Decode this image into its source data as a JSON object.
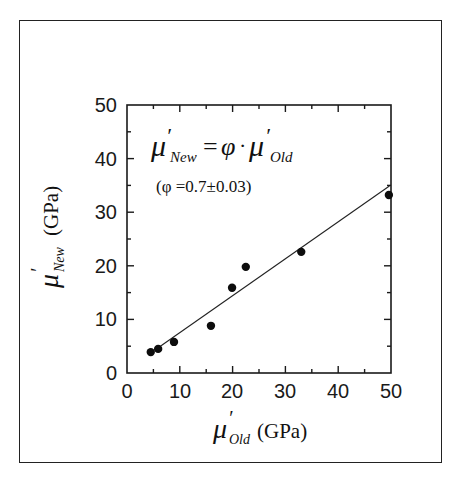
{
  "chart_data": {
    "type": "scatter",
    "title": "",
    "xlabel": "μ′_Old (GPa)",
    "ylabel": "μ′_New (GPa)",
    "xlim": [
      0,
      50
    ],
    "ylim": [
      0,
      50
    ],
    "x_ticks": [
      0,
      10,
      20,
      30,
      40,
      50
    ],
    "y_ticks": [
      0,
      10,
      20,
      30,
      40,
      50
    ],
    "minor_tick_step": 5,
    "grid": false,
    "legend": null,
    "series": [
      {
        "name": "data",
        "marker": "filled-circle",
        "points": [
          {
            "x": 4.5,
            "y": 3.9
          },
          {
            "x": 5.9,
            "y": 4.5
          },
          {
            "x": 8.9,
            "y": 5.8
          },
          {
            "x": 15.9,
            "y": 8.8
          },
          {
            "x": 19.9,
            "y": 15.9
          },
          {
            "x": 22.5,
            "y": 19.8
          },
          {
            "x": 33.0,
            "y": 22.6
          },
          {
            "x": 49.6,
            "y": 33.2
          }
        ]
      },
      {
        "name": "fit",
        "type": "line",
        "points": [
          {
            "x": 5.3,
            "y": 4.3
          },
          {
            "x": 49.7,
            "y": 34.9
          }
        ]
      }
    ],
    "annotations": [
      {
        "text": "μ′_New = φ · μ′_Old"
      },
      {
        "text": "(φ =0.7±0.03)"
      }
    ]
  },
  "labels": {
    "x_axis": {
      "mu": "μ",
      "prime": "′",
      "sub": "Old",
      "unit": "(GPa)"
    },
    "y_axis": {
      "mu": "μ",
      "prime": "′",
      "sub": "New",
      "unit": "(GPa)"
    },
    "equation": {
      "lhs_mu": "μ",
      "lhs_sub": "New",
      "eq": "=",
      "phi": "φ",
      "dot": "·",
      "rhs_mu": "μ",
      "rhs_sub": "Old"
    },
    "phi_note": "(φ =0.7±0.03)",
    "x_ticks": [
      "0",
      "10",
      "20",
      "30",
      "40",
      "50"
    ],
    "y_ticks": [
      "0",
      "10",
      "20",
      "30",
      "40",
      "50"
    ]
  }
}
